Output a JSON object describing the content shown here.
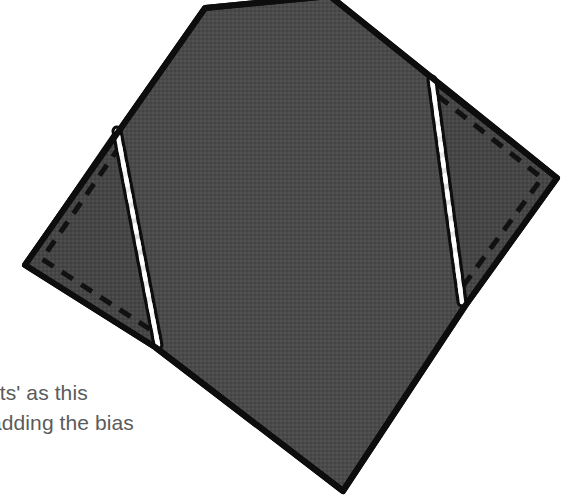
{
  "figure": {
    "colors": {
      "fabric_fill": "#4a4a4a",
      "fabric_fill_flap": "#454545",
      "outline": "#0d0d0d",
      "stitch_white": "#f2f2f2",
      "dashed_line": "#111111",
      "background": "#ffffff",
      "caption_text": "#5b5b5b"
    },
    "parts": [
      {
        "name": "main-fabric-body",
        "description": "large dark grey diamond shaped fabric piece"
      },
      {
        "name": "left-folded-flap",
        "description": "triangular folded-back flap on the left side"
      },
      {
        "name": "right-folded-flap",
        "description": "triangular folded-back flap on the right side"
      },
      {
        "name": "left-stitch-line",
        "description": "white topstitching line along left fold"
      },
      {
        "name": "right-stitch-line",
        "description": "white topstitching line along right fold"
      },
      {
        "name": "left-dashed-stitch-guide",
        "description": "dashed stitching guide inside left flap"
      },
      {
        "name": "right-dashed-stitch-guide",
        "description": "dashed stitching guide inside right flap"
      }
    ]
  },
  "caption": {
    "line1": "ets' as this",
    "line2": "adding the bias"
  }
}
